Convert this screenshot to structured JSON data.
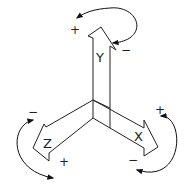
{
  "diagram": {
    "title": "",
    "colors": {
      "line": "#222222",
      "background": "#ffffff"
    },
    "axes": [
      {
        "id": "y",
        "label": "Y",
        "plus_label": "+",
        "minus_label": "−"
      },
      {
        "id": "z",
        "label": "Z",
        "plus_label": "+",
        "minus_label": "−"
      },
      {
        "id": "x",
        "label": "X",
        "plus_label": "+",
        "minus_label": "−"
      }
    ]
  }
}
